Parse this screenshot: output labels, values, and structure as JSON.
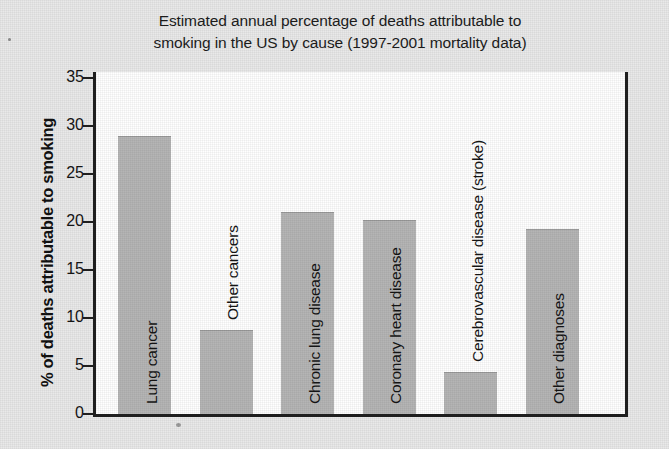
{
  "chart_data": {
    "type": "bar",
    "title": "Estimated annual percentage of deaths attributable to smoking in the US by cause (1997-2001 mortality data)",
    "title_lines": [
      "Estimated annual percentage of deaths attributable to",
      "smoking in the US by cause (1997-2001 mortality data)"
    ],
    "xlabel": "",
    "ylabel": "% of deaths attributable to smoking",
    "ylim": [
      0,
      35
    ],
    "ytick_step": 5,
    "yticks": [
      35,
      30,
      25,
      20,
      15,
      10,
      5,
      0
    ],
    "ytick_labels": [
      "35",
      "30",
      "25",
      "20",
      "15",
      "10",
      "5",
      "0"
    ],
    "grid": false,
    "legend": null,
    "bar_color": "#b5b5b5",
    "axis_color": "#202020",
    "plot_background": "#ffffff",
    "page_background": "#e9e9e9",
    "categories": [
      "Lung cancer",
      "Other cancers",
      "Chronic lung disease",
      "Coronary heart disease",
      "Cerebrovascular disease (stroke)",
      "Other diagnoses"
    ],
    "values": [
      29.0,
      8.8,
      21.0,
      20.2,
      4.4,
      19.3
    ]
  }
}
